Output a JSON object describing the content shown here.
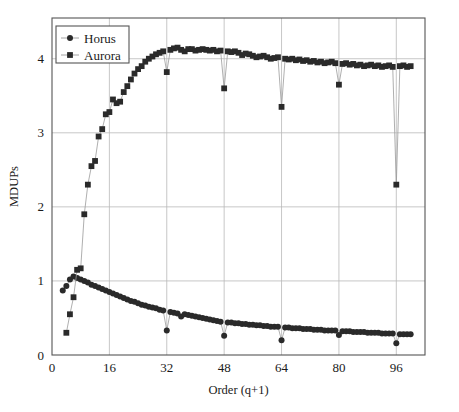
{
  "chart_data": {
    "type": "line",
    "title": "",
    "xlabel": "Order (q+1)",
    "ylabel": "MDUPs",
    "xlim": [
      0,
      104
    ],
    "ylim": [
      0,
      4.55
    ],
    "xticks": [
      0,
      16,
      32,
      48,
      64,
      80,
      96
    ],
    "yticks": [
      0,
      1,
      2,
      3,
      4
    ],
    "grid": true,
    "legend_position": "top-left",
    "marker_color": "#2a2a2a",
    "line_color": "#9a9a9a",
    "series": [
      {
        "name": "Horus",
        "marker": "circle",
        "x": [
          3,
          4,
          5,
          6,
          7,
          8,
          9,
          10,
          11,
          12,
          13,
          14,
          15,
          16,
          17,
          18,
          19,
          20,
          21,
          22,
          23,
          24,
          25,
          26,
          27,
          28,
          29,
          30,
          31,
          32,
          33,
          34,
          35,
          36,
          37,
          38,
          39,
          40,
          41,
          42,
          43,
          44,
          45,
          46,
          47,
          48,
          49,
          50,
          51,
          52,
          53,
          54,
          55,
          56,
          57,
          58,
          59,
          60,
          61,
          62,
          63,
          64,
          65,
          66,
          67,
          68,
          69,
          70,
          71,
          72,
          73,
          74,
          75,
          76,
          77,
          78,
          79,
          80,
          81,
          82,
          83,
          84,
          85,
          86,
          87,
          88,
          89,
          90,
          91,
          92,
          93,
          94,
          95,
          96,
          97,
          98,
          99,
          100
        ],
        "y": [
          0.87,
          0.93,
          1.02,
          1.06,
          1.04,
          1.02,
          1.0,
          0.98,
          0.95,
          0.93,
          0.91,
          0.89,
          0.87,
          0.85,
          0.83,
          0.81,
          0.79,
          0.77,
          0.75,
          0.73,
          0.72,
          0.7,
          0.68,
          0.67,
          0.65,
          0.64,
          0.63,
          0.61,
          0.6,
          0.33,
          0.58,
          0.57,
          0.56,
          0.52,
          0.55,
          0.54,
          0.53,
          0.52,
          0.51,
          0.5,
          0.49,
          0.48,
          0.47,
          0.46,
          0.45,
          0.26,
          0.44,
          0.44,
          0.43,
          0.43,
          0.42,
          0.42,
          0.41,
          0.41,
          0.4,
          0.4,
          0.39,
          0.39,
          0.38,
          0.38,
          0.38,
          0.2,
          0.37,
          0.37,
          0.36,
          0.36,
          0.36,
          0.35,
          0.35,
          0.35,
          0.34,
          0.34,
          0.34,
          0.33,
          0.33,
          0.33,
          0.33,
          0.27,
          0.32,
          0.32,
          0.32,
          0.31,
          0.31,
          0.31,
          0.31,
          0.3,
          0.3,
          0.3,
          0.3,
          0.29,
          0.29,
          0.29,
          0.29,
          0.16,
          0.28,
          0.28,
          0.28,
          0.28
        ]
      },
      {
        "name": "Aurora",
        "marker": "square",
        "x": [
          4,
          5,
          6,
          7,
          8,
          9,
          10,
          11,
          12,
          13,
          14,
          15,
          16,
          17,
          18,
          19,
          20,
          21,
          22,
          23,
          24,
          25,
          26,
          27,
          28,
          29,
          30,
          31,
          32,
          33,
          34,
          35,
          36,
          37,
          38,
          39,
          40,
          41,
          42,
          43,
          44,
          45,
          46,
          47,
          48,
          49,
          50,
          51,
          52,
          53,
          54,
          55,
          56,
          57,
          58,
          59,
          60,
          61,
          62,
          63,
          64,
          65,
          66,
          67,
          68,
          69,
          70,
          71,
          72,
          73,
          74,
          75,
          76,
          77,
          78,
          79,
          80,
          81,
          82,
          83,
          84,
          85,
          86,
          87,
          88,
          89,
          90,
          91,
          92,
          93,
          94,
          95,
          96,
          97,
          98,
          99,
          100
        ],
        "y": [
          0.3,
          0.55,
          0.78,
          1.15,
          1.17,
          1.9,
          2.3,
          2.55,
          2.62,
          2.95,
          3.05,
          3.25,
          3.28,
          3.45,
          3.4,
          3.42,
          3.55,
          3.63,
          3.72,
          3.8,
          3.86,
          3.9,
          3.96,
          4.0,
          4.03,
          4.06,
          4.08,
          4.1,
          3.82,
          4.12,
          4.14,
          4.15,
          4.12,
          4.1,
          4.13,
          4.13,
          4.11,
          4.12,
          4.13,
          4.12,
          4.11,
          4.12,
          4.1,
          4.11,
          3.6,
          4.1,
          4.09,
          4.1,
          4.08,
          4.05,
          4.07,
          4.06,
          4.04,
          4.02,
          4.03,
          4.04,
          4.02,
          4.0,
          4.01,
          4.02,
          3.35,
          4.0,
          3.99,
          4.0,
          3.98,
          3.99,
          3.97,
          3.98,
          3.96,
          3.97,
          3.95,
          3.96,
          3.94,
          3.95,
          3.96,
          3.94,
          3.65,
          3.93,
          3.94,
          3.92,
          3.93,
          3.91,
          3.92,
          3.9,
          3.91,
          3.92,
          3.9,
          3.91,
          3.89,
          3.9,
          3.91,
          3.89,
          2.3,
          3.9,
          3.91,
          3.89,
          3.9
        ]
      }
    ]
  },
  "legend": {
    "items": [
      {
        "label": "Horus",
        "marker": "circle"
      },
      {
        "label": "Aurora",
        "marker": "square"
      }
    ]
  },
  "axes": {
    "x_title": "Order (q+1)",
    "y_title": "MDUPs",
    "x_tick_labels": [
      "0",
      "16",
      "32",
      "48",
      "64",
      "80",
      "96"
    ],
    "y_tick_labels": [
      "0",
      "1",
      "2",
      "3",
      "4"
    ]
  }
}
